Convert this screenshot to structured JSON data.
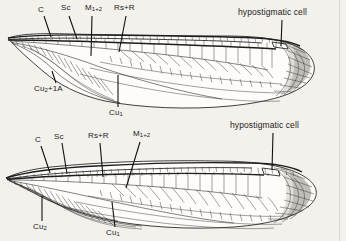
{
  "figure": {
    "ink_color": "#1d1d1d",
    "page_color": "#f3f1ec",
    "membrane_color": "#fdfcf9"
  },
  "forewing": {
    "name": "forewing",
    "labels": {
      "c": "C",
      "sc": "Sc",
      "m12": "M",
      "m12_sub": "1+2",
      "rs_r": "Rs+R",
      "hypostigmatic": "hypostigmatic cell",
      "cu2_1a": "Cu",
      "cu2_1a_sub": "2",
      "cu2_1a_tail": "+1A",
      "cu1": "Cu",
      "cu1_sub": "1"
    }
  },
  "hindwing": {
    "name": "hindwing",
    "labels": {
      "c": "C",
      "sc": "Sc",
      "rs_r": "Rs+R",
      "m12": "M",
      "m12_sub": "1+2",
      "hypostigmatic": "hypostigmatic cell",
      "cu2": "Cu",
      "cu2_sub": "2",
      "cu1": "Cu",
      "cu1_sub": "1"
    }
  }
}
